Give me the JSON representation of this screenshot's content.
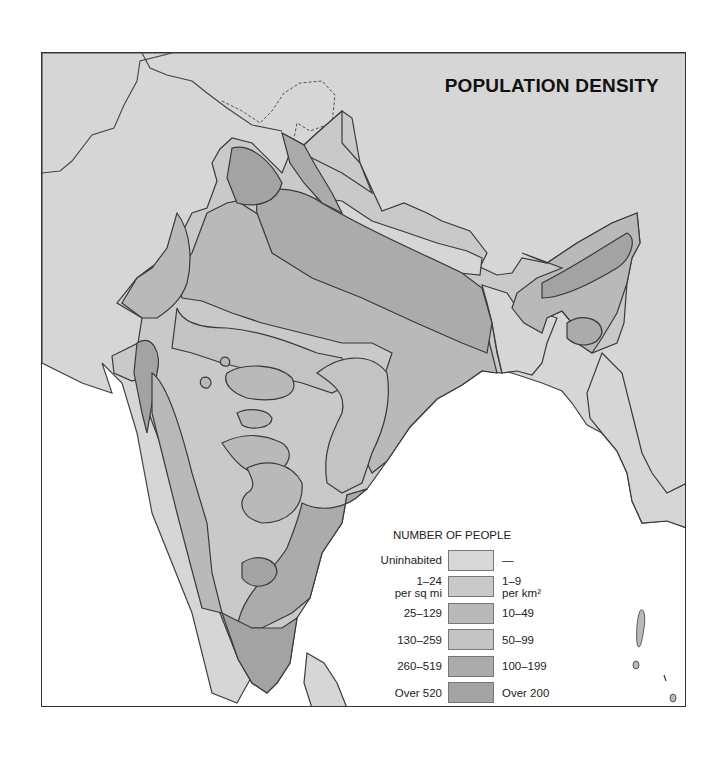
{
  "map": {
    "title": "POPULATION DENSITY",
    "colors": {
      "sea": "#ffffff",
      "neighbor_land": "#d6d6d6",
      "uninhabited": "#d8d8d8",
      "d1": "#c9c9c9",
      "d2": "#b9b9b9",
      "d3": "#c3c3c3",
      "d4": "#ababab",
      "d5": "#a3a3a3",
      "border": "#3a3a3a"
    }
  },
  "legend": {
    "heading": "NUMBER OF PEOPLE",
    "rows": [
      {
        "left": "Uninhabited",
        "left2": "",
        "right": "—",
        "right2": "",
        "color": "#d8d8d8"
      },
      {
        "left": "1–24",
        "left2": "per sq mi",
        "right": "1–9",
        "right2": "per km²",
        "color": "#c9c9c9"
      },
      {
        "left": "25–129",
        "left2": "",
        "right": "10–49",
        "right2": "",
        "color": "#b9b9b9"
      },
      {
        "left": "130–259",
        "left2": "",
        "right": "50–99",
        "right2": "",
        "color": "#c3c3c3"
      },
      {
        "left": "260–519",
        "left2": "",
        "right": "100–199",
        "right2": "",
        "color": "#ababab"
      },
      {
        "left": "Over 520",
        "left2": "",
        "right": "Over 200",
        "right2": "",
        "color": "#a3a3a3"
      }
    ]
  }
}
